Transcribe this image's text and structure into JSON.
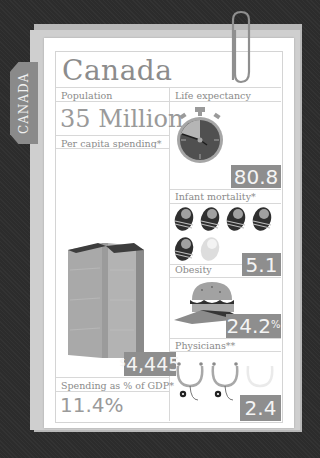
{
  "country": {
    "name": "Canada",
    "tab_label": "CANADA"
  },
  "population": {
    "label": "Population",
    "value": "35 Million"
  },
  "per_capita_spending": {
    "label": "Per capita spending*",
    "currency_symbol": "$",
    "value": "4,445",
    "icon": "stacked-bills-icon"
  },
  "spending_gdp": {
    "label": "Spending as % of GDP*",
    "value": "11.4%"
  },
  "life_expectancy": {
    "label": "Life expectancy",
    "value": "80.8",
    "icon": "stopwatch-icon"
  },
  "infant_mortality": {
    "label": "Infant mortality*",
    "value": "5.1",
    "icon": "swaddled-baby-icon",
    "full_icons": 5,
    "partial_icons": 1
  },
  "obesity": {
    "label": "Obesity",
    "value": "24.2",
    "unit": "%",
    "icon": "hamburger-icon"
  },
  "physicians": {
    "label": "Physicians**",
    "value": "2.4",
    "icon": "stethoscope-icon",
    "full_icons": 2,
    "partial_icons": 1
  },
  "colors": {
    "background": "#2c2c2c",
    "badge": "#8e8e8e",
    "text": "#8c8c8c",
    "paper": "#ffffff",
    "icon_dark": "#3a3a3a",
    "icon_mid": "#9a9a9a",
    "icon_light": "#c9c9c9"
  }
}
